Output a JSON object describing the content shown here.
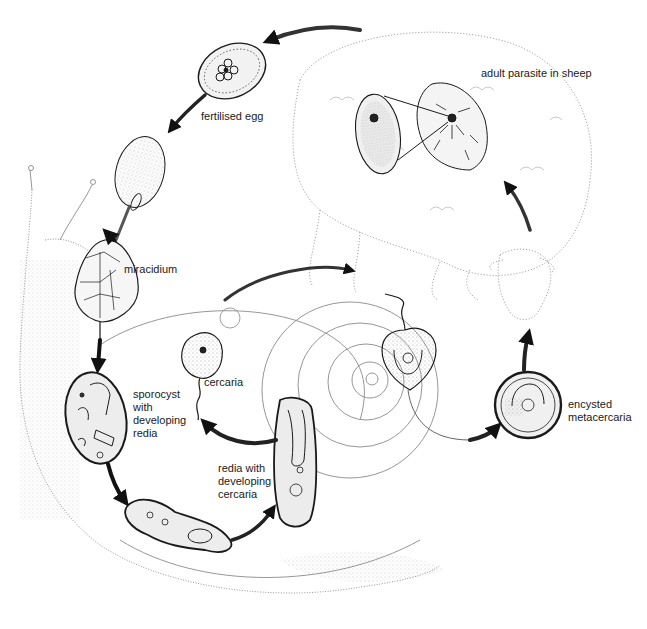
{
  "diagram": {
    "colors": {
      "ink": "#1a1a1a",
      "stipple": "#9a9a9a",
      "background": "#ffffff"
    },
    "stages": [
      {
        "id": "adult",
        "label": "adult parasite in sheep"
      },
      {
        "id": "egg",
        "label": "fertilised egg"
      },
      {
        "id": "miracidium",
        "label": "miracidium"
      },
      {
        "id": "sporocyst",
        "label_lines": [
          "sporocyst",
          "with",
          "developing",
          "redia"
        ]
      },
      {
        "id": "cercaria",
        "label": "cercaria"
      },
      {
        "id": "redia",
        "label_lines": [
          "redia with",
          "developing",
          "cercaria"
        ]
      },
      {
        "id": "metacercaria",
        "label_lines": [
          "encysted",
          "metacercaria"
        ]
      }
    ],
    "hosts": [
      {
        "id": "sheep",
        "name": "sheep"
      },
      {
        "id": "snail",
        "name": "snail"
      }
    ]
  }
}
